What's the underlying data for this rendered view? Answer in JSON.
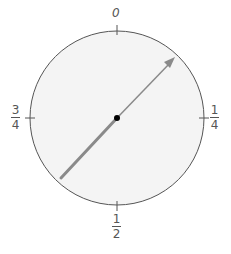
{
  "diagram": {
    "type": "spinner-dial",
    "labels": {
      "top": "0",
      "right": {
        "numerator": "1",
        "denominator": "4"
      },
      "bottom": {
        "numerator": "1",
        "denominator": "2"
      },
      "left": {
        "numerator": "3",
        "denominator": "4"
      }
    },
    "arrow": {
      "direction": "toward 1/8 (between 0 and 1/4)",
      "color": "#8a8a8a"
    },
    "colors": {
      "circle_fill": "#f4f4f4",
      "circle_stroke": "#555555",
      "center_dot": "#000000"
    }
  }
}
